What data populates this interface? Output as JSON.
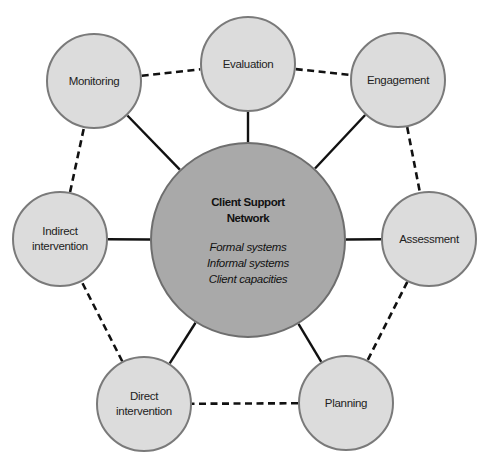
{
  "diagram": {
    "center": {
      "title_lines": [
        "Client Support",
        "Network"
      ],
      "items": [
        "Formal systems",
        "Informal systems",
        "Client capacities"
      ],
      "x": 248,
      "y": 240,
      "r": 98,
      "fill": "#a9a9a9",
      "stroke": "#6e6e6e"
    },
    "nodes": [
      {
        "id": "evaluation",
        "lines": [
          "Evaluation"
        ],
        "x": 248,
        "y": 64
      },
      {
        "id": "engagement",
        "lines": [
          "Engagement"
        ],
        "x": 398,
        "y": 80
      },
      {
        "id": "assessment",
        "lines": [
          "Assessment"
        ],
        "x": 429,
        "y": 239
      },
      {
        "id": "planning",
        "lines": [
          "Planning"
        ],
        "x": 346,
        "y": 403
      },
      {
        "id": "direct-intervention",
        "lines": [
          "Direct",
          "intervention"
        ],
        "x": 144,
        "y": 404
      },
      {
        "id": "indirect-intervention",
        "lines": [
          "Indirect",
          "intervention"
        ],
        "x": 60,
        "y": 239
      },
      {
        "id": "monitoring",
        "lines": [
          "Monitoring"
        ],
        "x": 94,
        "y": 81
      }
    ],
    "node_style": {
      "r": 48,
      "fill": "#dcdcdc",
      "stroke": "#7a7a7a"
    },
    "solid_edges": [
      [
        "center",
        "evaluation"
      ],
      [
        "center",
        "engagement"
      ],
      [
        "center",
        "assessment"
      ],
      [
        "center",
        "planning"
      ],
      [
        "center",
        "direct-intervention"
      ],
      [
        "center",
        "indirect-intervention"
      ],
      [
        "center",
        "monitoring"
      ]
    ],
    "dashed_edges": [
      [
        "monitoring",
        "evaluation"
      ],
      [
        "evaluation",
        "engagement"
      ],
      [
        "engagement",
        "assessment"
      ],
      [
        "assessment",
        "planning"
      ],
      [
        "planning",
        "direct-intervention"
      ],
      [
        "direct-intervention",
        "indirect-intervention"
      ],
      [
        "indirect-intervention",
        "monitoring"
      ]
    ],
    "line_color": "#111111"
  }
}
